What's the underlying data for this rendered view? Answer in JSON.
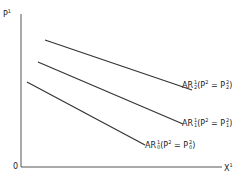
{
  "axes": {
    "y_label": "P",
    "y_label_sup": "1",
    "x_label": "X",
    "x_label_sup": "1",
    "origin": "0"
  },
  "curves": [
    {
      "name": "AR",
      "sup": "1",
      "sub": "2",
      "cond_lhs": "P",
      "cond_lhs_sup": "2",
      "eq": "=",
      "cond_rhs": "P",
      "cond_rhs_sup": "2",
      "cond_rhs_sub": "2"
    },
    {
      "name": "AR",
      "sup": "1",
      "sub": "1",
      "cond_lhs": "P",
      "cond_lhs_sup": "2",
      "eq": "=",
      "cond_rhs": "P",
      "cond_rhs_sup": "2",
      "cond_rhs_sub": "1"
    },
    {
      "name": "AR",
      "sup": "1",
      "sub": "0",
      "cond_lhs": "P",
      "cond_lhs_sup": "2",
      "eq": "=",
      "cond_rhs": "P",
      "cond_rhs_sup": "2",
      "cond_rhs_sub": "0"
    }
  ]
}
